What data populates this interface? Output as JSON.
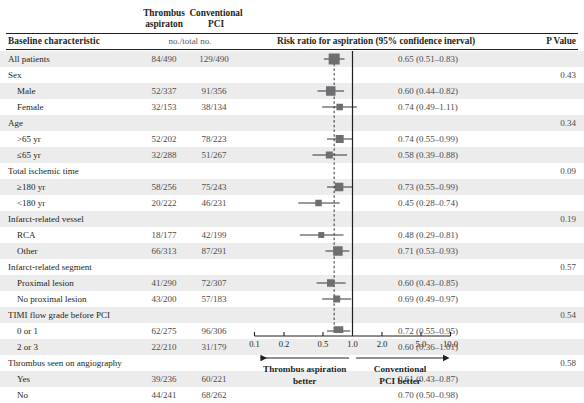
{
  "header": {
    "group_a": "Thrombus aspiraton",
    "group_b": "Conventional PCI",
    "baseline_label": "Baseline characteristic",
    "no_total_label": "no./total no.",
    "risk_title": "Risk ratio for aspiration (95% confidence inerval)",
    "p_value_label": "P Value"
  },
  "axis": {
    "ticks": [
      "0.1",
      "0.2",
      "0.5",
      "1.0",
      "2.0",
      "5.0",
      "10.0"
    ],
    "tick_values": [
      0.1,
      0.2,
      0.5,
      1.0,
      2.0,
      5.0,
      10.0
    ],
    "left_arrow_label_line1": "Thrombus aspiration",
    "left_arrow_label_line2": "better",
    "right_arrow_label_line1": "Conventional",
    "right_arrow_label_line2": "PCI better",
    "reference_line": "1.0",
    "overall_dashed_line": "0.65"
  },
  "colors": {
    "band": "#ececed",
    "marker": "#6d6e71",
    "ci_line": "#231f20",
    "axis": "#231f20",
    "text": "#231f20",
    "muted_text": "#4b4b4d"
  },
  "chart_data": {
    "type": "forest",
    "title": "Risk ratio for aspiration (95% confidence inerval)",
    "xlabel": "Risk ratio",
    "xscale": "log",
    "xlim": [
      0.1,
      10.0
    ],
    "reference": 1.0,
    "pooled_estimate": 0.65,
    "grid": false,
    "rows": [
      {
        "kind": "total",
        "label": "All patients",
        "a": "84/490",
        "b": "129/490",
        "rr": "0.65 (0.51–0.83)",
        "est": 0.65,
        "lo": 0.51,
        "hi": 0.83,
        "size": 11.0,
        "p": ""
      },
      {
        "kind": "section",
        "label": "Sex",
        "a": "",
        "b": "",
        "rr": "",
        "est": null,
        "lo": null,
        "hi": null,
        "size": 0,
        "p": "0.43"
      },
      {
        "kind": "data",
        "label": "Male",
        "a": "52/337",
        "b": "91/356",
        "rr": "0.60 (0.44–0.82)",
        "est": 0.6,
        "lo": 0.44,
        "hi": 0.82,
        "size": 9.5,
        "p": ""
      },
      {
        "kind": "data",
        "label": "Female",
        "a": "32/153",
        "b": "38/134",
        "rr": "0.74 (0.49–1.11)",
        "est": 0.74,
        "lo": 0.49,
        "hi": 1.11,
        "size": 6.5,
        "p": ""
      },
      {
        "kind": "section",
        "label": "Age",
        "a": "",
        "b": "",
        "rr": "",
        "est": null,
        "lo": null,
        "hi": null,
        "size": 0,
        "p": "0.34"
      },
      {
        "kind": "data",
        "label": ">65 yr",
        "a": "52/202",
        "b": "78/223",
        "rr": "0.74 (0.55–0.99)",
        "est": 0.74,
        "lo": 0.55,
        "hi": 0.99,
        "size": 8.0,
        "p": ""
      },
      {
        "kind": "data",
        "label": "≤65 yr",
        "a": "32/288",
        "b": "51/267",
        "rr": "0.58 (0.39–0.88)",
        "est": 0.58,
        "lo": 0.39,
        "hi": 0.88,
        "size": 7.0,
        "p": ""
      },
      {
        "kind": "section",
        "label": "Total ischemic time",
        "a": "",
        "b": "",
        "rr": "",
        "est": null,
        "lo": null,
        "hi": null,
        "size": 0,
        "p": "0.09"
      },
      {
        "kind": "data",
        "label": "≥180 yr",
        "a": "58/256",
        "b": "75/243",
        "rr": "0.73 (0.55–0.99)",
        "est": 0.73,
        "lo": 0.55,
        "hi": 0.99,
        "size": 8.5,
        "p": ""
      },
      {
        "kind": "data",
        "label": "<180 yr",
        "a": "20/222",
        "b": "46/231",
        "rr": "0.45 (0.28–0.74)",
        "est": 0.45,
        "lo": 0.28,
        "hi": 0.74,
        "size": 6.5,
        "p": ""
      },
      {
        "kind": "section",
        "label": "Infarct-related vessel",
        "a": "",
        "b": "",
        "rr": "",
        "est": null,
        "lo": null,
        "hi": null,
        "size": 0,
        "p": "0.19"
      },
      {
        "kind": "data",
        "label": "RCA",
        "a": "18/177",
        "b": "42/199",
        "rr": "0.48 (0.29–0.81)",
        "est": 0.48,
        "lo": 0.29,
        "hi": 0.81,
        "size": 6.0,
        "p": ""
      },
      {
        "kind": "data",
        "label": "Other",
        "a": "66/313",
        "b": "87/291",
        "rr": "0.71 (0.53–0.93)",
        "est": 0.71,
        "lo": 0.53,
        "hi": 0.93,
        "size": 9.5,
        "p": ""
      },
      {
        "kind": "section",
        "label": "Infarct-related segment",
        "a": "",
        "b": "",
        "rr": "",
        "est": null,
        "lo": null,
        "hi": null,
        "size": 0,
        "p": "0.57"
      },
      {
        "kind": "data",
        "label": "Proximal lesion",
        "a": "41/290",
        "b": "72/307",
        "rr": "0.60 (0.43–0.85)",
        "est": 0.6,
        "lo": 0.43,
        "hi": 0.85,
        "size": 7.5,
        "p": ""
      },
      {
        "kind": "data",
        "label": "No proximal lesion",
        "a": "43/200",
        "b": "57/183",
        "rr": "0.69 (0.49–0.97)",
        "est": 0.69,
        "lo": 0.49,
        "hi": 0.97,
        "size": 7.0,
        "p": ""
      },
      {
        "kind": "section",
        "label": "TIMI flow grade before PCI",
        "a": "",
        "b": "",
        "rr": "",
        "est": null,
        "lo": null,
        "hi": null,
        "size": 0,
        "p": "0.54"
      },
      {
        "kind": "data",
        "label": "0 or 1",
        "a": "62/275",
        "b": "96/306",
        "rr": "0.72 (0.55–0.95)",
        "est": 0.72,
        "lo": 0.55,
        "hi": 0.95,
        "size": 9.5,
        "p": ""
      },
      {
        "kind": "data",
        "label": "2 or 3",
        "a": "22/210",
        "b": "31/179",
        "rr": "0.60 (0.36–1.01)",
        "est": 0.6,
        "lo": 0.36,
        "hi": 1.01,
        "size": 6.0,
        "p": ""
      },
      {
        "kind": "section",
        "label": "Thrombus seen on angiography",
        "a": "",
        "b": "",
        "rr": "",
        "est": null,
        "lo": null,
        "hi": null,
        "size": 0,
        "p": "0.58"
      },
      {
        "kind": "data",
        "label": "Yes",
        "a": "39/236",
        "b": "60/221",
        "rr": "0.61 (0.43–0.87)",
        "est": 0.61,
        "lo": 0.43,
        "hi": 0.87,
        "size": 7.5,
        "p": ""
      },
      {
        "kind": "data",
        "label": "No",
        "a": "44/241",
        "b": "68/262",
        "rr": "0.70 (0.50–0.98)",
        "est": 0.7,
        "lo": 0.5,
        "hi": 0.98,
        "size": 7.0,
        "p": ""
      }
    ]
  }
}
